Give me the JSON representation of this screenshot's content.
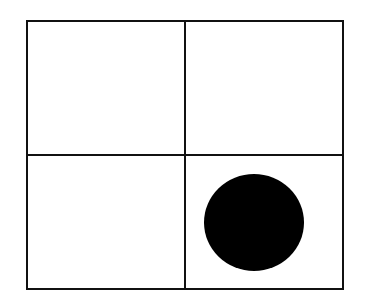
{
  "diagram": {
    "type": "2x2 grid",
    "cells": [
      {
        "row": 0,
        "col": 0,
        "content": "empty"
      },
      {
        "row": 0,
        "col": 1,
        "content": "empty"
      },
      {
        "row": 1,
        "col": 0,
        "content": "empty"
      },
      {
        "row": 1,
        "col": 1,
        "content": "filled-circle"
      }
    ],
    "colors": {
      "line": "#111111",
      "dot": "#000000",
      "background": "#ffffff"
    }
  }
}
